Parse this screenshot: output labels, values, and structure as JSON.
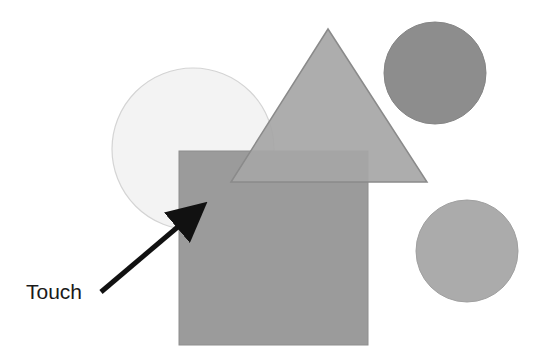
{
  "diagram": {
    "background": "#ffffff",
    "label": {
      "text": "Touch",
      "x": 26,
      "y": 281
    },
    "shapes": {
      "large_circle": {
        "cx": 193,
        "cy": 149,
        "r": 81,
        "fill": "#f3f3f3",
        "stroke": "#d4d4d4"
      },
      "square": {
        "x": 179,
        "y": 151,
        "width": 189,
        "height": 194,
        "fill": "#9b9b9b",
        "stroke": "#8e8e8e"
      },
      "triangle": {
        "points": "328,29 231,182 427,182",
        "fill": "#a6a6a6",
        "stroke": "#8a8a8a"
      },
      "dark_circle": {
        "cx": 435,
        "cy": 73,
        "r": 51,
        "fill": "#8d8d8d",
        "stroke": "#858585"
      },
      "light_circle": {
        "cx": 467,
        "cy": 251,
        "r": 51,
        "fill": "#ababab",
        "stroke": "#a0a0a0"
      }
    },
    "arrow": {
      "x1": 101,
      "y1": 292,
      "x2": 206,
      "y2": 203,
      "color": "#111111"
    }
  }
}
